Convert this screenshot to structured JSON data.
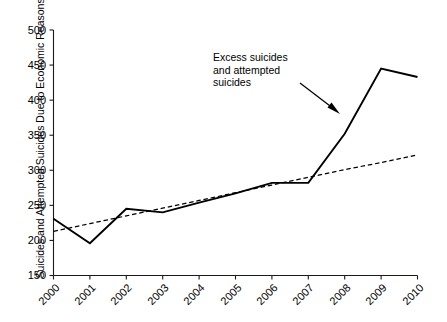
{
  "chart_data": {
    "type": "line",
    "title": "",
    "xlabel": "",
    "ylabel": "Suicides and Attempted Suicides Due to Economic Reasons",
    "x": [
      2000,
      2001,
      2002,
      2003,
      2004,
      2005,
      2006,
      2007,
      2008,
      2009,
      2010
    ],
    "categories": [
      "2000",
      "2001",
      "2002",
      "2003",
      "2004",
      "2005",
      "2006",
      "2007",
      "2008",
      "2009",
      "2010"
    ],
    "xlim": [
      2000,
      2010
    ],
    "ylim": [
      150,
      500
    ],
    "yticks": [
      150,
      200,
      250,
      300,
      350,
      400,
      450,
      500
    ],
    "ytick_labels": [
      "150",
      "200",
      "250",
      "300",
      "350",
      "400",
      "450",
      "500"
    ],
    "grid": false,
    "legend": null,
    "series": [
      {
        "name": "Suicides and attempted suicides due to economic reasons",
        "style": "solid",
        "values": [
          231,
          196,
          245,
          240,
          254,
          267,
          282,
          282,
          352,
          445,
          433
        ]
      },
      {
        "name": "Linear trend",
        "style": "dashed",
        "values": [
          213,
          224,
          235,
          246,
          257,
          268,
          279,
          290,
          301,
          311,
          322
        ]
      }
    ],
    "annotations": [
      {
        "text": "Excess suicides\nand attempted\nsuicides",
        "arrow": true,
        "arrow_from_x": 2007.3,
        "arrow_from_y": 420,
        "arrow_to_x": 2008.0,
        "arrow_to_y": 380
      }
    ]
  },
  "annotation_text": "Excess suicides\nand attempted\nsuicides"
}
